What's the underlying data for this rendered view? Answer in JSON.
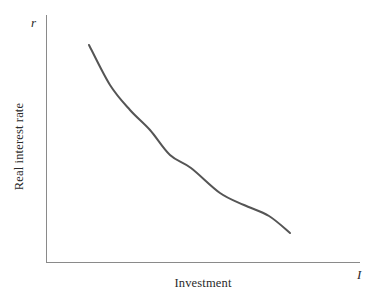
{
  "figure": {
    "background_color": "#ffffff",
    "width": 385,
    "height": 299
  },
  "axes": {
    "y_variable_symbol": "r",
    "x_variable_symbol": "I",
    "y_axis_title": "Real interest rate",
    "x_axis_title": "Investment",
    "axis_color": "#8a8a8a",
    "origin_px": [
      46,
      262
    ],
    "y_axis_top_px": [
      46,
      15
    ],
    "x_axis_right_px": [
      360,
      262
    ]
  },
  "chart_data": {
    "type": "line",
    "title": "",
    "subtitle": "",
    "xlabel": "Investment",
    "ylabel": "Real interest rate",
    "x_axis_symbol": "I",
    "y_axis_symbol": "r",
    "grid": false,
    "legend": false,
    "legend_position": "none",
    "xlim": [
      0,
      100
    ],
    "ylim": [
      0,
      100
    ],
    "xticks": [],
    "yticks": [],
    "xticklabels": [],
    "yticklabels": [],
    "annotations": [],
    "series": [
      {
        "name": "Investment demand",
        "color": "#555555",
        "linewidth": 2,
        "shape": "convex-decreasing",
        "x": [
          13.7,
          20.4,
          26.8,
          33.2,
          39.5,
          46.2,
          55.4,
          63.1,
          71.0,
          77.7
        ],
        "y": [
          87.9,
          71.7,
          61.5,
          53.6,
          47.1,
          41.7,
          34.4,
          29.6,
          25.1,
          21.9
        ],
        "points_px": [
          [
            89,
            45
          ],
          [
            110,
            85
          ],
          [
            130,
            110
          ],
          [
            150,
            130
          ],
          [
            170,
            155
          ],
          [
            191,
            168
          ],
          [
            220,
            193
          ],
          [
            244,
            205
          ],
          [
            269,
            216
          ],
          [
            290,
            233
          ]
        ]
      }
    ]
  }
}
